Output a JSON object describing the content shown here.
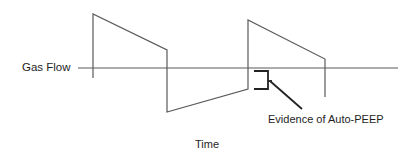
{
  "diagram": {
    "y_axis_label": "Gas Flow",
    "x_axis_label": "Time",
    "annotation": "Evidence of Auto-PEEP",
    "colors": {
      "waveform": "#555555",
      "axis": "#555555",
      "bracket": "#222222",
      "text": "#1e1e1e",
      "background": "#ffffff"
    },
    "waveform_points": [
      [
        93,
        78
      ],
      [
        93,
        14
      ],
      [
        167,
        50
      ],
      [
        167,
        112
      ],
      [
        248,
        89
      ],
      [
        248,
        20
      ],
      [
        325,
        59
      ],
      [
        325,
        97
      ]
    ],
    "axis": {
      "x1": 78,
      "x2": 398,
      "y": 68
    }
  }
}
